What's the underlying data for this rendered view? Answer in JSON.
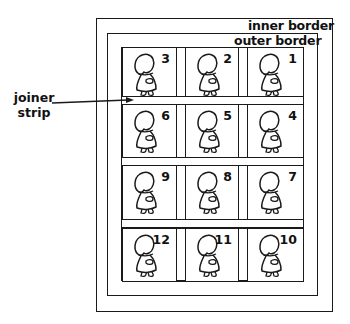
{
  "labels": {
    "inner_border": "inner border",
    "outer_border": "outer border",
    "joiner_strip_line1": "joiner",
    "joiner_strip_line2": "strip"
  },
  "blocks": [
    {
      "number": "3"
    },
    {
      "number": "2"
    },
    {
      "number": "1"
    },
    {
      "number": "6"
    },
    {
      "number": "5"
    },
    {
      "number": "4"
    },
    {
      "number": "9"
    },
    {
      "number": "8"
    },
    {
      "number": "7"
    },
    {
      "number": "12"
    },
    {
      "number": "11"
    },
    {
      "number": "10"
    }
  ],
  "colors": {
    "line": "#1a1a1a",
    "background": "#ffffff"
  }
}
